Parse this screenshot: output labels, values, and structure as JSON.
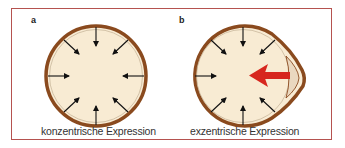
{
  "figure": {
    "panels": [
      {
        "id": "a",
        "label": "a",
        "caption": "konzentrische Expression"
      },
      {
        "id": "b",
        "label": "b",
        "caption": "exzentrische Expression"
      }
    ],
    "colors": {
      "frame": "#b5524f",
      "outer_ring": "#8a4a1e",
      "fill": "#f8ebd3",
      "inner_ring": "#c9b79c",
      "arrows": "#111111",
      "force_arrow": "#d7261e",
      "bulge_fill": "#ead8bf"
    }
  }
}
